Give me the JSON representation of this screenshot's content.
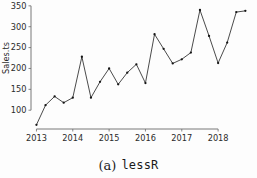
{
  "figure": {
    "caption_index": "(a)",
    "caption_name": "lessR"
  },
  "chart_data": {
    "type": "line",
    "title": "",
    "subtitle": "",
    "xlabel": "",
    "ylabel": "Sales.ts",
    "xlim": [
      2012.85,
      2018.85
    ],
    "ylim": [
      55,
      352
    ],
    "grid": false,
    "legend": false,
    "legend_position": "none",
    "marker": "filled-circle",
    "line_color": "#2a2a2a",
    "marker_color": "#151515",
    "yticks": [
      100,
      150,
      200,
      250,
      300,
      350
    ],
    "ytick_labels": [
      "100",
      "150",
      "200",
      "250",
      "300",
      "350"
    ],
    "xticks": [
      2013,
      2014,
      2015,
      2016,
      2017,
      2018
    ],
    "xtick_labels": [
      "2013",
      "2014",
      "2015",
      "2016",
      "2017",
      "2018"
    ],
    "x": [
      2013.0,
      2013.25,
      2013.5,
      2013.75,
      2014.0,
      2014.25,
      2014.5,
      2014.75,
      2015.0,
      2015.25,
      2015.5,
      2015.75,
      2016.0,
      2016.25,
      2016.5,
      2016.75,
      2017.0,
      2017.25,
      2017.5,
      2017.75,
      2018.0,
      2018.25,
      2018.5,
      2018.75
    ],
    "values": [
      65,
      112,
      133,
      118,
      130,
      228,
      130,
      168,
      200,
      162,
      190,
      210,
      165,
      282,
      247,
      212,
      222,
      238,
      340,
      278,
      213,
      262,
      335,
      338
    ],
    "series": [
      {
        "name": "Sales.ts",
        "values": [
          65,
          112,
          133,
          118,
          130,
          228,
          130,
          168,
          200,
          162,
          190,
          210,
          165,
          282,
          247,
          212,
          222,
          238,
          340,
          278,
          213,
          262,
          335,
          338
        ]
      }
    ]
  }
}
